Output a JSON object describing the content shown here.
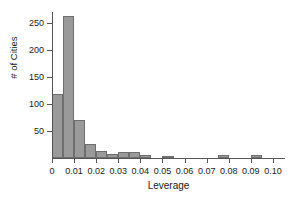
{
  "chart_data": {
    "type": "bar",
    "title": "",
    "subtitle": "",
    "xlabel": "Leverage",
    "ylabel": "# of Cities",
    "grid": false,
    "legend": false,
    "legend_position": "none",
    "bin_width": 0.005,
    "xlim": [
      0,
      0.105
    ],
    "ylim": [
      0,
      270
    ],
    "xticks": [
      0,
      0.01,
      0.02,
      0.03,
      0.04,
      0.05,
      0.06,
      0.07,
      0.08,
      0.09,
      0.1
    ],
    "xtick_labels": [
      "0",
      "0.01",
      "0.02",
      "0.03",
      "0.04",
      "0.05",
      "0.06",
      "0.07",
      "0.08",
      "0.09",
      "0.10"
    ],
    "yticks": [
      50,
      100,
      150,
      200,
      250
    ],
    "ytick_labels": [
      "50",
      "100",
      "150",
      "200",
      "250"
    ],
    "bin_starts": [
      0.0,
      0.005,
      0.01,
      0.015,
      0.02,
      0.025,
      0.03,
      0.035,
      0.04,
      0.045,
      0.05,
      0.055,
      0.06,
      0.065,
      0.07,
      0.075,
      0.08,
      0.085,
      0.09,
      0.095,
      0.1
    ],
    "bin_ends": [
      0.005,
      0.01,
      0.015,
      0.02,
      0.025,
      0.03,
      0.035,
      0.04,
      0.045,
      0.05,
      0.055,
      0.06,
      0.065,
      0.07,
      0.075,
      0.08,
      0.085,
      0.09,
      0.095,
      0.1,
      0.105
    ],
    "values": [
      118,
      262,
      71,
      26,
      13,
      8,
      11,
      11,
      6,
      0,
      4,
      0,
      0,
      0,
      0,
      5,
      0,
      0,
      5,
      0,
      0
    ],
    "bar_fill": "#9a9a9a",
    "bar_stroke": "#6e6e6e",
    "axis_color": "#555555",
    "text_color": "#1a1a1a",
    "background": "#ffffff"
  }
}
